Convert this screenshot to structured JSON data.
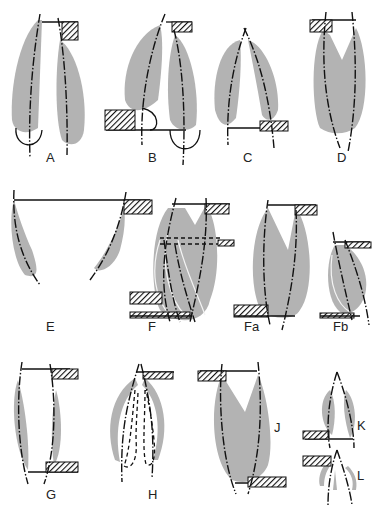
{
  "figure": {
    "panels": [
      {
        "id": "A",
        "label": "A"
      },
      {
        "id": "B",
        "label": "B"
      },
      {
        "id": "C",
        "label": "C"
      },
      {
        "id": "D",
        "label": "D"
      },
      {
        "id": "E",
        "label": "E"
      },
      {
        "id": "F",
        "label": "F"
      },
      {
        "id": "Fa",
        "label": "Fa"
      },
      {
        "id": "Fb",
        "label": "Fb"
      },
      {
        "id": "G",
        "label": "G"
      },
      {
        "id": "H",
        "label": "H"
      },
      {
        "id": "J",
        "label": "J"
      },
      {
        "id": "K",
        "label": "K"
      },
      {
        "id": "L",
        "label": "L"
      }
    ]
  },
  "colors": {
    "shade": "#b3b3b3",
    "line": "#111111",
    "background": "#ffffff"
  }
}
